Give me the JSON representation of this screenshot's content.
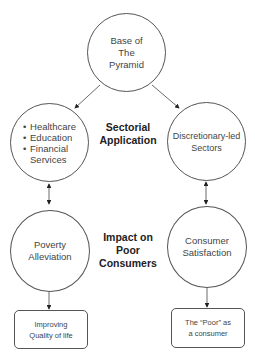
{
  "diagram": {
    "root": {
      "lines": [
        "Base of",
        "The",
        "Pyramid"
      ]
    },
    "left_sector": {
      "bullets": [
        "Healthcare",
        "Education",
        "Financial"
      ],
      "continuation": "Services"
    },
    "right_sector": {
      "lines": [
        "Discretionary-led",
        "Sectors"
      ]
    },
    "sectorial_label": {
      "lines": [
        "Sectorial",
        "Application"
      ]
    },
    "left_impact": {
      "lines": [
        "Poverty",
        "Alleviation"
      ]
    },
    "right_impact": {
      "lines": [
        "Consumer",
        "Satisfaction"
      ]
    },
    "impact_label": {
      "lines": [
        "Impact on",
        "Poor",
        "Consumers"
      ]
    },
    "left_outcome": {
      "lines": [
        "Improving",
        "Quality of life"
      ]
    },
    "right_outcome": {
      "lines": [
        "The “Poor” as",
        "a consumer"
      ]
    }
  }
}
